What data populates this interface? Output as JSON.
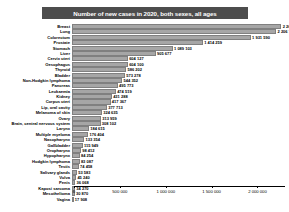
{
  "chart_data": {
    "type": "bar",
    "orientation": "horizontal",
    "title": "Number of new cases in 2020, both sexes, all ages",
    "xlabel": "",
    "ylabel": "",
    "xlim": [
      0,
      2300000
    ],
    "grid": false,
    "legend": null,
    "bar_color": "#a6a6a6",
    "title_band_color": "#4d4d4d",
    "title_text_color": "#ffffff",
    "xticks": [
      0,
      500000,
      1000000,
      1500000,
      2000000
    ],
    "xticklabels": [
      "0",
      "500 000",
      "1 000 000",
      "1 500 000",
      "2 000 000"
    ],
    "categories": [
      "Breast",
      "Lung",
      "Colorectum",
      "Prostate",
      "Stomach",
      "Liver",
      "Cervix uteri",
      "Oesophagus",
      "Thyroid",
      "Bladder",
      "Non-Hodgkin lymphoma",
      "Pancreas",
      "Leukaemia",
      "Kidney",
      "Corpus uteri",
      "Lip, oral cavity",
      "Melanoma of skin",
      "Ovary",
      "Brain, central nervous system",
      "Larynx",
      "Multiple myeloma",
      "Nasopharynx",
      "Gallbladder",
      "Oropharynx",
      "Hypopharynx",
      "Hodgkin lymphoma",
      "Testis",
      "Salivary glands",
      "Vulva",
      "Penis",
      "Kaposi sarcoma",
      "Mesothelioma",
      "Vagina"
    ],
    "values": [
      2261419,
      2206771,
      1931590,
      1414259,
      1089103,
      905677,
      604127,
      604100,
      586202,
      573278,
      544352,
      495773,
      474519,
      431288,
      417367,
      377713,
      324635,
      313959,
      308102,
      184615,
      176404,
      133354,
      115949,
      98412,
      84254,
      83087,
      74458,
      53583,
      45240,
      36068,
      34270,
      30870,
      17908
    ],
    "value_labels": [
      "2 261 419",
      "2 206 771",
      "1 931 590",
      "1 414 259",
      "1 089 103",
      "905 677",
      "604 127",
      "604 100",
      "586 202",
      "573 278",
      "544 352",
      "495 773",
      "474 519",
      "431 288",
      "417 367",
      "377 713",
      "324 635",
      "313 959",
      "308 102",
      "184 615",
      "176 404",
      "133 354",
      "115 949",
      "98 412",
      "84 254",
      "83 087",
      "74 458",
      "53 583",
      "45 240",
      "36 068",
      "34 270",
      "30 870",
      "17 908"
    ]
  }
}
